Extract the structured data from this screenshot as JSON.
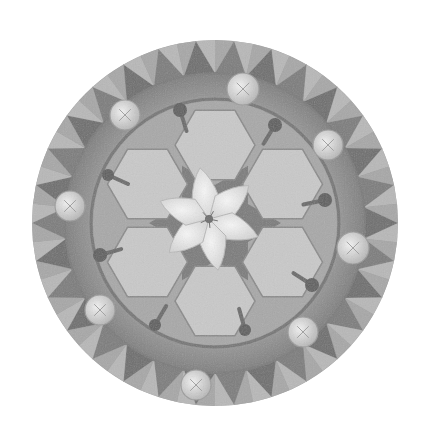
{
  "image": {
    "subject": "grayscale circular mandala mosaic with central white six-petal flower",
    "background": "#ffffff",
    "circle": {
      "cx": 215,
      "cy": 223,
      "r": 183
    }
  },
  "palette": {
    "outer_base": "#9a9a9a",
    "tooth_dark": "#6e6e6e",
    "tooth_light": "#bdbdbd",
    "band": "#8c8c8c",
    "band_shadow": "#7a7a7a",
    "inner_field": "#a8a8a8",
    "petal_tile": "#c9c9c9",
    "petal_tile_edge": "#8a8a8a",
    "star_dark": "#7c7c7c",
    "flower": "#ededed",
    "flower_edge": "#b8b8b8",
    "flower_center": "#6a6a6a",
    "medallion": "#dcdcdc",
    "medallion_edge": "#9c9c9c",
    "bead_dark": "#5e5e5e"
  },
  "rings": {
    "teeth_count": 30,
    "teeth_outer_r": 183,
    "teeth_inner_r": 150,
    "band_outer_r": 150,
    "band_inner_r": 122,
    "inner_r": 122
  },
  "inner_tiles": {
    "count": 6,
    "ring_r": 78,
    "tile_r": 40,
    "rotation_deg": 0
  },
  "star": {
    "points": 6,
    "outer_r": 66,
    "inner_r": 38,
    "rotation_deg": 30
  },
  "flower": {
    "petals": 6,
    "petal_length": 52,
    "petal_width": 24,
    "rotation_deg": -10,
    "center_dx": -6,
    "center_dy": -4
  },
  "medallions": [
    {
      "x": 243,
      "y": 89,
      "r": 16
    },
    {
      "x": 125,
      "y": 115,
      "r": 15
    },
    {
      "x": 328,
      "y": 145,
      "r": 15
    },
    {
      "x": 70,
      "y": 206,
      "r": 15
    },
    {
      "x": 353,
      "y": 248,
      "r": 16
    },
    {
      "x": 100,
      "y": 310,
      "r": 15
    },
    {
      "x": 303,
      "y": 332,
      "r": 15
    },
    {
      "x": 196,
      "y": 385,
      "r": 15
    }
  ],
  "beads": [
    {
      "x": 180,
      "y": 110,
      "r": 7
    },
    {
      "x": 275,
      "y": 125,
      "r": 7
    },
    {
      "x": 108,
      "y": 175,
      "r": 6
    },
    {
      "x": 325,
      "y": 200,
      "r": 7
    },
    {
      "x": 100,
      "y": 255,
      "r": 7
    },
    {
      "x": 312,
      "y": 285,
      "r": 7
    },
    {
      "x": 155,
      "y": 325,
      "r": 6
    },
    {
      "x": 245,
      "y": 330,
      "r": 6
    }
  ]
}
